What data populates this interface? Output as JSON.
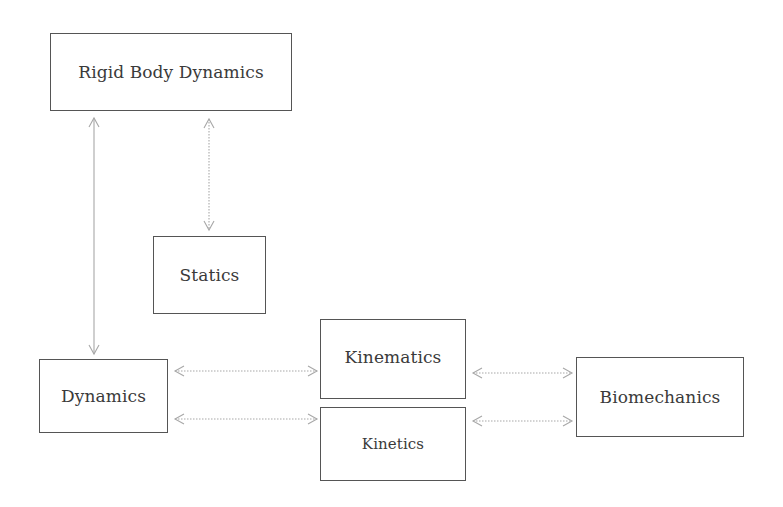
{
  "diagram": {
    "type": "concept-map",
    "background": "#ffffff",
    "colors": {
      "box_border": "#555555",
      "text": "#3a3a3a",
      "arrow": "#a8a8a8"
    },
    "nodes": {
      "rigid_body_dynamics": {
        "label": "Rigid Body Dynamics"
      },
      "statics": {
        "label": "Statics"
      },
      "dynamics": {
        "label": "Dynamics"
      },
      "kinematics": {
        "label": "Kinematics"
      },
      "kinetics": {
        "label": "Kinetics"
      },
      "biomechanics": {
        "label": "Biomechanics"
      }
    },
    "edges": [
      {
        "from": "Rigid Body Dynamics",
        "to": "Dynamics",
        "direction": "both",
        "style": "solid"
      },
      {
        "from": "Rigid Body Dynamics",
        "to": "Statics",
        "direction": "both",
        "style": "dotted"
      },
      {
        "from": "Dynamics",
        "to": "Kinematics",
        "direction": "both",
        "style": "dotted"
      },
      {
        "from": "Dynamics",
        "to": "Kinetics",
        "direction": "both",
        "style": "dotted"
      },
      {
        "from": "Kinematics",
        "to": "Biomechanics",
        "direction": "both",
        "style": "dotted"
      },
      {
        "from": "Kinetics",
        "to": "Biomechanics",
        "direction": "both",
        "style": "dotted"
      }
    ]
  }
}
